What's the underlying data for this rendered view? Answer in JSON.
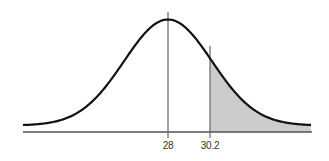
{
  "chart_data": {
    "type": "area",
    "title": "",
    "xlabel": "",
    "ylabel": "",
    "distribution": "normal",
    "mean": 28,
    "shaded_region": {
      "from": 30.2,
      "to": "infinity",
      "side": "right"
    },
    "tick_labels": [
      "28",
      "30.2"
    ],
    "vertical_lines": [
      28,
      30.2
    ],
    "grid": false,
    "legend": null,
    "colors": {
      "curve": "#111111",
      "shade": "#c8c8c8",
      "axis": "#555555"
    }
  },
  "labels": {
    "mean": "28",
    "cutoff": "30.2"
  }
}
